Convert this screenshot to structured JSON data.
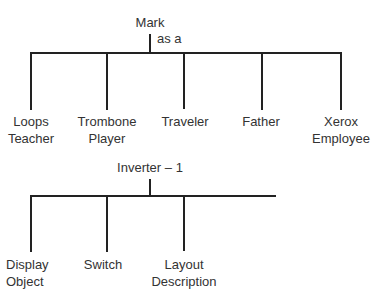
{
  "tree1": {
    "root": "Mark",
    "connector": "as a",
    "children": [
      {
        "line1": "Loops",
        "line2": "Teacher"
      },
      {
        "line1": "Trombone",
        "line2": "Player"
      },
      {
        "line1": "Traveler",
        "line2": ""
      },
      {
        "line1": "Father",
        "line2": ""
      },
      {
        "line1": "Xerox",
        "line2": "Employee"
      }
    ]
  },
  "tree2": {
    "root": "Inverter – 1",
    "children": [
      {
        "line1": "Display",
        "line2": "Object"
      },
      {
        "line1": "Switch",
        "line2": ""
      },
      {
        "line1": "Layout",
        "line2": "Description"
      }
    ]
  }
}
